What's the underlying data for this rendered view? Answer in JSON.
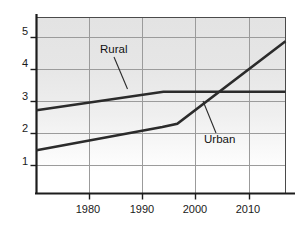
{
  "chart_data": {
    "type": "line",
    "title": "",
    "xlabel": "",
    "ylabel": "",
    "xlim": [
      1970.2,
      2016.9
    ],
    "ylim": [
      0.12,
      5.62
    ],
    "grid": true,
    "legend_position": "inline-annotations",
    "x_ticks": [
      1980,
      1990,
      2000,
      2010
    ],
    "x_tick_labels": [
      "1980",
      "1990",
      "2000",
      "2010"
    ],
    "y_ticks": [
      1,
      2,
      3,
      4,
      5
    ],
    "y_tick_labels": [
      "1",
      "2",
      "3",
      "4",
      "5"
    ],
    "series": [
      {
        "name": "Rural",
        "color": "#2b2b2b",
        "x": [
          1970.2,
          1994.0,
          2016.9
        ],
        "values": [
          2.72,
          3.3,
          3.3
        ]
      },
      {
        "name": "Urban",
        "color": "#2b2b2b",
        "x": [
          1970.2,
          1993.8,
          1996.6,
          2016.9
        ],
        "values": [
          1.47,
          2.2,
          2.3,
          4.88
        ]
      }
    ],
    "annotations": [
      {
        "text": "Rural",
        "x": 1989.0,
        "y": 4.35
      },
      {
        "text": "Urban",
        "x": 2002.0,
        "y": 1.85
      }
    ],
    "crossover_point": {
      "x": 2004.5,
      "y": 3.3
    }
  },
  "axes": {
    "plot_background_top_color": "#e2e2e2",
    "plot_background_bottom_color": "#ffffff",
    "grid_color": "#9a9a9a",
    "axis_color": "#1c1c1c"
  }
}
